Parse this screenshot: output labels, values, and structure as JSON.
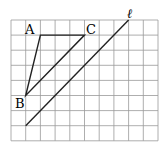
{
  "diagram": {
    "grid": {
      "cols": 10,
      "rows": 8,
      "left": 11,
      "top": 20,
      "cell_w": 14.7,
      "cell_h": 15.1,
      "color": "#999999"
    },
    "points": [
      {
        "label": "A",
        "gx": 2,
        "gy": 1
      },
      {
        "label": "B",
        "gx": 1,
        "gy": 5
      },
      {
        "label": "C",
        "gx": 5,
        "gy": 1
      }
    ],
    "line_label": "ℓ",
    "line": {
      "from": [
        1,
        7
      ],
      "to": [
        8,
        0
      ]
    },
    "stroke_color": "#222222"
  }
}
